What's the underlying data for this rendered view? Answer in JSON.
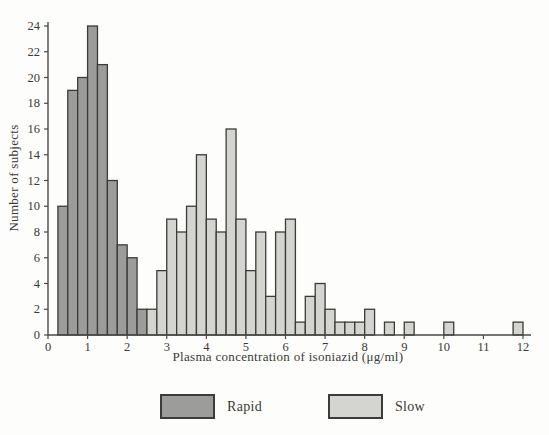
{
  "figure": {
    "kind": "scanned-textbook-histogram"
  },
  "legend": {
    "rapid_label": "Rapid",
    "slow_label": "Slow"
  },
  "chart_data": {
    "type": "bar",
    "subtype": "histogram",
    "title": "",
    "xlabel": "Plasma concentration of isoniazid (μg/ml)",
    "ylabel": "Number of subjects",
    "xlim": [
      0,
      12
    ],
    "ylim": [
      0,
      24
    ],
    "x_ticks": [
      0,
      1,
      2,
      3,
      4,
      5,
      6,
      7,
      8,
      9,
      10,
      11,
      12
    ],
    "y_ticks": [
      0,
      2,
      4,
      6,
      8,
      10,
      12,
      14,
      16,
      18,
      20,
      22,
      24
    ],
    "grid": false,
    "legend_position": "bottom",
    "bin_width": 0.25,
    "axis_color": "#4a4945",
    "bar_stroke_color": "#3c3b38",
    "series": [
      {
        "name": "Rapid",
        "color": "#9c9c9a",
        "bin_start": 0.25,
        "bin_width": 0.25,
        "values": [
          10,
          19,
          20,
          24,
          21,
          12,
          7,
          6,
          2
        ]
      },
      {
        "name": "Slow",
        "color": "#d4d4d0",
        "bin_start": 2.5,
        "bin_width": 0.25,
        "values": [
          2,
          5,
          9,
          8,
          10,
          14,
          9,
          8,
          16,
          9,
          5,
          8,
          3,
          8,
          9,
          1,
          3,
          4,
          2,
          1,
          1,
          1,
          2,
          0,
          1,
          0,
          1,
          0,
          0,
          0,
          1,
          0,
          0,
          0,
          0,
          0,
          0,
          1
        ]
      }
    ]
  }
}
